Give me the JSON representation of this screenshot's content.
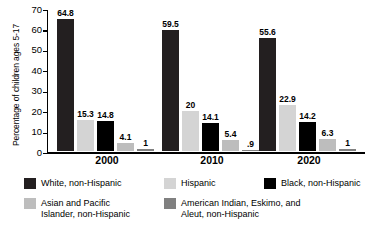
{
  "chart_data": {
    "type": "bar",
    "title": "",
    "xlabel": "",
    "ylabel": "Percentage of children ages 5-17",
    "ylim": [
      0,
      70
    ],
    "yticks": [
      "0",
      "10",
      "20",
      "30",
      "40",
      "50",
      "60",
      "70"
    ],
    "grid": false,
    "legend_position": "bottom",
    "categories": [
      "2000",
      "2010",
      "2020"
    ],
    "series": [
      {
        "name": "White, non-Hispanic",
        "color": "#231f20",
        "values": [
          64.8,
          59.5,
          55.6
        ],
        "labels": [
          "64.8",
          "59.5",
          "55.6"
        ]
      },
      {
        "name": "Hispanic",
        "color": "#d4d4d4",
        "values": [
          15.3,
          20,
          22.9
        ],
        "labels": [
          "15.3",
          "20",
          "22.9"
        ]
      },
      {
        "name": "Black, non-Hispanic",
        "color": "#000000",
        "values": [
          14.8,
          14.1,
          14.2
        ],
        "labels": [
          "14.8",
          "14.1",
          "14.2"
        ]
      },
      {
        "name": "Asian and Pacific Islander, non-Hispanic",
        "color": "#bdbdbd",
        "values": [
          4.1,
          5.4,
          6.3
        ],
        "labels": [
          "4.1",
          "5.4",
          "6.3"
        ]
      },
      {
        "name": "American Indian, Eskimo, and Aleut, non-Hispanic",
        "color": "#808080",
        "values": [
          1,
          0.9,
          1
        ],
        "labels": [
          "1",
          ".9",
          "1"
        ]
      }
    ]
  },
  "axis": {
    "y_label": "Percentage of children ages 5-17",
    "y_ticks": [
      "70",
      "60",
      "50",
      "40",
      "30",
      "20",
      "10",
      "0"
    ]
  },
  "groups": [
    {
      "label": "2000",
      "bars": [
        {
          "value_label": "64.8",
          "value": 64.8,
          "color": "#231f20"
        },
        {
          "value_label": "15.3",
          "value": 15.3,
          "color": "#d4d4d4"
        },
        {
          "value_label": "14.8",
          "value": 14.8,
          "color": "#000000"
        },
        {
          "value_label": "4.1",
          "value": 4.1,
          "color": "#bdbdbd"
        },
        {
          "value_label": "1",
          "value": 1,
          "color": "#808080"
        }
      ]
    },
    {
      "label": "2010",
      "bars": [
        {
          "value_label": "59.5",
          "value": 59.5,
          "color": "#231f20"
        },
        {
          "value_label": "20",
          "value": 20,
          "color": "#d4d4d4"
        },
        {
          "value_label": "14.1",
          "value": 14.1,
          "color": "#000000"
        },
        {
          "value_label": "5.4",
          "value": 5.4,
          "color": "#bdbdbd"
        },
        {
          "value_label": ".9",
          "value": 0.9,
          "color": "#808080"
        }
      ]
    },
    {
      "label": "2020",
      "bars": [
        {
          "value_label": "55.6",
          "value": 55.6,
          "color": "#231f20"
        },
        {
          "value_label": "22.9",
          "value": 22.9,
          "color": "#d4d4d4"
        },
        {
          "value_label": "14.2",
          "value": 14.2,
          "color": "#000000"
        },
        {
          "value_label": "6.3",
          "value": 6.3,
          "color": "#bdbdbd"
        },
        {
          "value_label": "1",
          "value": 1,
          "color": "#808080"
        }
      ]
    }
  ],
  "legend": {
    "items": [
      {
        "label": "White, non-Hispanic",
        "color": "#231f20"
      },
      {
        "label": "Hispanic",
        "color": "#d4d4d4"
      },
      {
        "label": "Black, non-Hispanic",
        "color": "#000000"
      },
      {
        "label": "Asian and Pacific\nIslander, non-Hispanic",
        "color": "#bdbdbd"
      },
      {
        "label": "American Indian, Eskimo, and\nAleut, non-Hispanic",
        "color": "#808080"
      }
    ]
  }
}
